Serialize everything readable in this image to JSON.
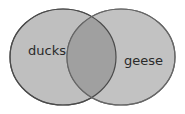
{
  "diagram": {
    "type": "venn",
    "sets": [
      {
        "label": "ducks",
        "fill": "#bdbdbd",
        "stroke": "#555555"
      },
      {
        "label": "geese",
        "fill": "#bdbdbd",
        "stroke": "#555555"
      }
    ],
    "overlap_fill": "#9e9e9e"
  }
}
